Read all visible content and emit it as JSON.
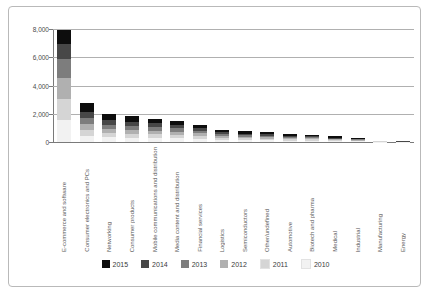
{
  "chart_data": {
    "type": "bar",
    "stacked": true,
    "title": "",
    "subtitle": "",
    "xlabel": "",
    "ylabel": "",
    "ylim": [
      0,
      8000
    ],
    "yticks": [
      0,
      2000,
      4000,
      6000,
      8000
    ],
    "ytick_labels": [
      "0",
      "2,000",
      "4,000",
      "6,000",
      "8,000"
    ],
    "grid": true,
    "legend_position": "bottom",
    "orientation": "vertical",
    "categories": [
      "E-commerce and software",
      "Consumer electronics and PCs",
      "Networking",
      "Consumer products",
      "Mobile communications and distribution",
      "Media content and distribution",
      "Financial services",
      "Logistics",
      "Semiconductors",
      "Other/undefined",
      "Automotive",
      "Biotech and pharma",
      "Medical",
      "Industrial",
      "Manufacturing",
      "Energy"
    ],
    "series": [
      {
        "name": "2010",
        "color": "#f2f2f2",
        "values": [
          1550,
          440,
          320,
          300,
          280,
          250,
          210,
          150,
          130,
          120,
          100,
          95,
          70,
          55,
          20,
          10
        ]
      },
      {
        "name": "2011",
        "color": "#d5d5d5",
        "values": [
          1500,
          430,
          310,
          290,
          270,
          245,
          200,
          145,
          125,
          115,
          95,
          90,
          65,
          50,
          18,
          9
        ]
      },
      {
        "name": "2012",
        "color": "#b0b0b0",
        "values": [
          1450,
          420,
          305,
          285,
          265,
          240,
          195,
          140,
          120,
          110,
          90,
          85,
          60,
          45,
          16,
          8
        ]
      },
      {
        "name": "2013",
        "color": "#7d7d7d",
        "values": [
          1350,
          410,
          300,
          280,
          255,
          230,
          190,
          135,
          115,
          105,
          88,
          80,
          55,
          40,
          14,
          7
        ]
      },
      {
        "name": "2014",
        "color": "#474747",
        "values": [
          1100,
          400,
          290,
          270,
          245,
          220,
          180,
          130,
          110,
          100,
          85,
          75,
          50,
          35,
          12,
          6
        ]
      },
      {
        "name": "2015",
        "color": "#0d0d0d",
        "values": [
          950,
          700,
          480,
          390,
          330,
          300,
          260,
          180,
          150,
          140,
          130,
          110,
          95,
          55,
          25,
          12
        ]
      }
    ],
    "totals": [
      7900,
      2800,
      2005,
      1815,
      1645,
      1485,
      1235,
      880,
      750,
      690,
      588,
      535,
      395,
      280,
      105,
      52
    ],
    "legend": [
      "2015",
      "2014",
      "2013",
      "2012",
      "2011",
      "2010"
    ],
    "legend_colors": [
      "#0d0d0d",
      "#474747",
      "#7d7d7d",
      "#b0b0b0",
      "#d5d5d5",
      "#f2f2f2"
    ]
  }
}
